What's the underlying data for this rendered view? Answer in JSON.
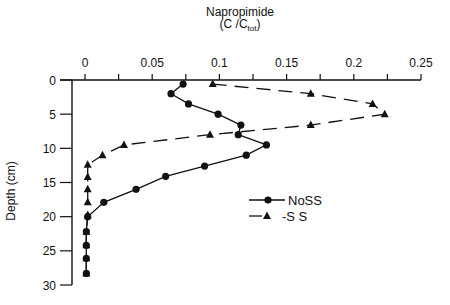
{
  "chart_data": {
    "type": "line",
    "title": "Napropimide",
    "subtitle_main": "(C /C",
    "subtitle_sub": "tot",
    "subtitle_end": ")",
    "xlabel": "Napropimide (C/Ctot)",
    "ylabel": "Depth (cm)",
    "xlim": [
      0,
      0.25
    ],
    "ylim": [
      0,
      30
    ],
    "y_inverted": true,
    "x_axis_position": "top",
    "x_ticks": [
      0,
      0.05,
      0.1,
      0.15,
      0.2,
      0.25
    ],
    "x_tick_labels": [
      "0",
      "0.05",
      "0.1",
      "0.15",
      "0.2",
      "0.25"
    ],
    "x_minor_step": 0.025,
    "y_ticks": [
      0,
      5,
      10,
      15,
      20,
      25,
      30
    ],
    "y_tick_labels": [
      "0",
      "5",
      "10",
      "15",
      "20",
      "25",
      "30"
    ],
    "grid": false,
    "legend_position": "lower right (inside)",
    "series": [
      {
        "name": "NoSS",
        "marker": "circle",
        "line": "solid",
        "x": [
          0.073,
          0.064,
          0.077,
          0.099,
          0.116,
          0.114,
          0.135,
          0.12,
          0.089,
          0.06,
          0.038,
          0.014,
          0.002,
          0.001,
          0.001,
          0.001,
          0.001
        ],
        "y": [
          0.6,
          2.0,
          3.5,
          5.0,
          6.6,
          8.0,
          9.5,
          11.0,
          12.6,
          14.1,
          16.0,
          17.9,
          20.0,
          22.2,
          24.2,
          26.1,
          28.3
        ]
      },
      {
        "name": "-S S",
        "marker": "triangle",
        "line": "dashed",
        "x": [
          0.095,
          0.168,
          0.214,
          0.223,
          0.168,
          0.093,
          0.029,
          0.013,
          0.002,
          0.002,
          0.002,
          0.002,
          0.002,
          0.001,
          0.001,
          0.001,
          0.001
        ],
        "y": [
          0.6,
          2.0,
          3.5,
          5.0,
          6.6,
          8.0,
          9.5,
          11.0,
          12.4,
          14.2,
          16.0,
          17.9,
          19.8,
          22.2,
          24.2,
          26.1,
          28.3
        ]
      }
    ]
  },
  "legend": {
    "items": [
      {
        "label": "NoSS",
        "marker": "circle",
        "line": "solid"
      },
      {
        "label": "-S S",
        "marker": "triangle",
        "line": "dashed"
      }
    ]
  },
  "colors": {
    "ink": "#111111",
    "background": "#ffffff"
  }
}
